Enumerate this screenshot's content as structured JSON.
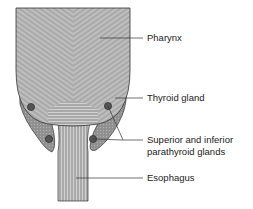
{
  "labels": {
    "pharynx": "Pharynx",
    "thyroid": "Thyroid gland",
    "parathyroid_line1": "Superior and inferior",
    "parathyroid_line2": "parathyroid glands",
    "esophagus": "Esophagus"
  },
  "colors": {
    "tissue": "#a9a9a9",
    "stripe": "#d6d6d6",
    "thyroid": "#8f8f8f",
    "parathyroid": "#555555",
    "outline": "#333333",
    "leader": "#333333"
  }
}
